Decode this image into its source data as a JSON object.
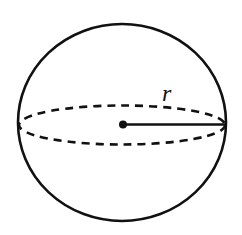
{
  "diagram": {
    "shape": "sphere",
    "radius_label": "r",
    "stroke_color": "#111111",
    "background_color": "#ffffff",
    "geometry": {
      "center": [
        123,
        123.5
      ],
      "outline_rx": 104,
      "outline_ry": 99,
      "equator_rx": 104,
      "equator_ry": 19,
      "radius_end": [
        226,
        124
      ],
      "label_position": [
        166,
        101
      ]
    }
  }
}
